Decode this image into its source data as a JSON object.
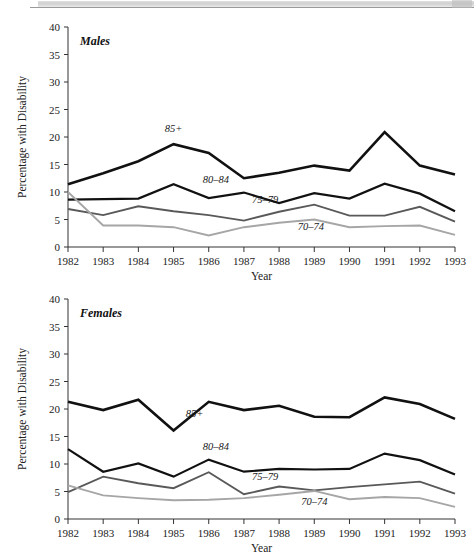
{
  "figure": {
    "y_axis_title": "Percentage with Disability",
    "x_axis_title": "Year"
  },
  "panels": [
    {
      "key": "males",
      "title": "Males"
    },
    {
      "key": "females",
      "title": "Females"
    }
  ],
  "series_colors": {
    "85+": "#111111",
    "80-84": "#111111",
    "75-79": "#595959",
    "70-74": "#a6a6a6"
  },
  "series_labels": {
    "s85": "85+",
    "s80": "80–84",
    "s75": "75–79",
    "s70": "70–74"
  },
  "chart_data": [
    {
      "type": "line",
      "title": "Males",
      "xlabel": "Year",
      "ylabel": "Percentage with Disability",
      "categories": [
        1982,
        1983,
        1984,
        1985,
        1986,
        1987,
        1988,
        1989,
        1990,
        1991,
        1992,
        1993
      ],
      "xlim": [
        1982,
        1993
      ],
      "ylim": [
        0,
        40
      ],
      "yticks": [
        0,
        5,
        10,
        15,
        20,
        25,
        30,
        35,
        40
      ],
      "xticks": [
        "1982",
        "1983",
        "1984",
        "1985",
        "1986",
        "1987",
        "1988",
        "1989",
        "1990",
        "1991",
        "1992",
        "1993"
      ],
      "grid": false,
      "legend": "inline-annotations",
      "series": [
        {
          "name": "85+",
          "color": "#111111",
          "values": [
            11.4,
            13.4,
            15.6,
            18.7,
            17.1,
            12.5,
            13.5,
            14.8,
            13.9,
            20.9,
            14.8,
            13.2
          ]
        },
        {
          "name": "80-84",
          "color": "#111111",
          "values": [
            8.6,
            8.7,
            8.8,
            11.4,
            8.9,
            9.9,
            8.0,
            9.8,
            8.8,
            11.5,
            9.7,
            6.5
          ]
        },
        {
          "name": "75-79",
          "color": "#595959",
          "values": [
            6.9,
            5.8,
            7.4,
            6.5,
            5.8,
            4.8,
            6.4,
            7.7,
            5.7,
            5.7,
            7.3,
            4.6
          ]
        },
        {
          "name": "70-74",
          "color": "#a6a6a6",
          "values": [
            10.0,
            3.9,
            3.9,
            3.6,
            2.1,
            3.6,
            4.4,
            5.0,
            3.6,
            3.8,
            3.9,
            2.2
          ]
        }
      ],
      "annotations": [
        {
          "text": "85+",
          "x": 1985,
          "y": 21.0
        },
        {
          "text": "80–84",
          "x": 1986.2,
          "y": 11.6
        },
        {
          "text": "75–79",
          "x": 1987.6,
          "y": 8.0
        },
        {
          "text": "70–74",
          "x": 1988.9,
          "y": 3.1
        }
      ]
    },
    {
      "type": "line",
      "title": "Females",
      "xlabel": "Year",
      "ylabel": "Percentage with Disability",
      "categories": [
        1982,
        1983,
        1984,
        1985,
        1986,
        1987,
        1988,
        1989,
        1990,
        1991,
        1992,
        1993
      ],
      "xlim": [
        1982,
        1993
      ],
      "ylim": [
        0,
        40
      ],
      "yticks": [
        0,
        5,
        10,
        15,
        20,
        25,
        30,
        35,
        40
      ],
      "xticks": [
        "1982",
        "1983",
        "1984",
        "1985",
        "1986",
        "1987",
        "1988",
        "1989",
        "1990",
        "1991",
        "1992",
        "1993"
      ],
      "grid": false,
      "legend": "inline-annotations",
      "series": [
        {
          "name": "85+",
          "color": "#111111",
          "values": [
            21.3,
            19.8,
            21.7,
            16.1,
            21.3,
            19.8,
            20.6,
            18.6,
            18.5,
            22.1,
            20.9,
            18.2
          ]
        },
        {
          "name": "80-84",
          "color": "#111111",
          "values": [
            12.7,
            8.6,
            10.1,
            7.7,
            10.8,
            8.6,
            9.1,
            9.0,
            9.1,
            11.9,
            10.7,
            8.1
          ]
        },
        {
          "name": "75-79",
          "color": "#595959",
          "values": [
            4.9,
            7.7,
            6.5,
            5.6,
            8.5,
            4.5,
            5.9,
            5.2,
            5.8,
            6.3,
            6.8,
            4.6
          ]
        },
        {
          "name": "70-74",
          "color": "#a6a6a6",
          "values": [
            6.1,
            4.3,
            3.8,
            3.4,
            3.5,
            3.8,
            4.4,
            5.1,
            3.6,
            4.0,
            3.8,
            2.2
          ]
        }
      ],
      "annotations": [
        {
          "text": "85+",
          "x": 1985.6,
          "y": 18.6
        },
        {
          "text": "80–84",
          "x": 1986.2,
          "y": 12.6
        },
        {
          "text": "75–79",
          "x": 1987.6,
          "y": 7.1
        },
        {
          "text": "70–74",
          "x": 1989.0,
          "y": 2.5
        }
      ]
    }
  ]
}
